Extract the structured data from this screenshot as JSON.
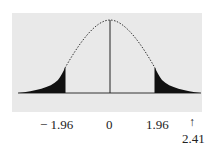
{
  "diagram": {
    "type": "normal-distribution-two-tailed",
    "shaded_regions": [
      "left tail below -1.96",
      "right tail above 1.96"
    ],
    "critical_values": [
      -1.96,
      1.96
    ],
    "center": 0,
    "test_statistic": 2.41,
    "labels": {
      "left_critical": "− 1.96",
      "center": "0",
      "right_critical": "1.96",
      "arrow": "↑",
      "statistic": "2.41"
    },
    "colors": {
      "panel": "#e9e9e9",
      "fill": "#111111",
      "line": "#222222"
    }
  }
}
